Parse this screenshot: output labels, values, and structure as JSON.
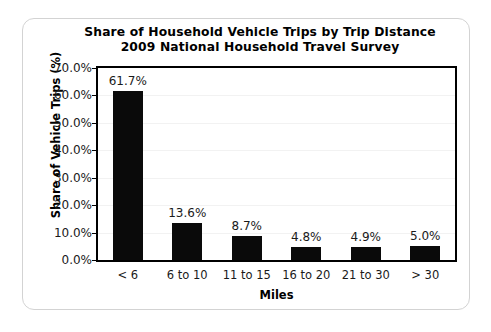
{
  "chart_data": {
    "type": "bar",
    "title": "Share of Household Vehicle Trips by Trip Distance",
    "subtitle": "2009 National Household Travel Survey",
    "title_line1": "Share of Household Vehicle Trips by Trip Distance",
    "title_line2": "2009 National Household Travel Survey",
    "xlabel": "Miles",
    "ylabel": "Share of Vehicle Trips (%)",
    "categories": [
      "< 6",
      "6 to 10",
      "11 to 15",
      "16 to 20",
      "21 to 30",
      "> 30"
    ],
    "values": [
      61.7,
      13.6,
      8.7,
      4.8,
      4.9,
      5.0
    ],
    "data_labels": [
      "61.7%",
      "13.6%",
      "8.7%",
      "4.8%",
      "4.9%",
      "5.0%"
    ],
    "ylim": [
      0,
      70
    ],
    "ytick_values": [
      0,
      10,
      20,
      30,
      40,
      50,
      60,
      70
    ],
    "ytick_labels": [
      "0.0%",
      "10.0%",
      "20.0%",
      "30.0%",
      "40.0%",
      "50.0%",
      "60.0%",
      "70.0%"
    ],
    "grid": true,
    "legend": false,
    "bar_color": "#0a0a0a",
    "gridline_color": "#f2f2f2",
    "axis_color": "#000000",
    "background_color": "#ffffff",
    "card_border_color": "#d3d3d3"
  }
}
